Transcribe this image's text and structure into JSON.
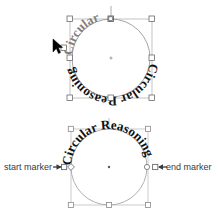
{
  "canvas": {
    "width": 220,
    "height": 221,
    "background": "#ffffff"
  },
  "colors": {
    "path_stroke": "#9a9a9a",
    "bbox_stroke": "#b0b0b0",
    "handle_fill": "#ffffff",
    "handle_stroke": "#555555",
    "text_dark": "#111111",
    "text_gray": "#8a8a8a",
    "label_text": "#3a3a3a",
    "cursor": "#000000"
  },
  "objects": {
    "top": {
      "name": "selected-text-on-circle",
      "text_upper": "Circular",
      "text_lower": "Circular Reasoning",
      "full_text": "Circular Reasoning",
      "selected": true,
      "bbox": {
        "x": 70,
        "y": 19,
        "width": 82,
        "height": 79
      },
      "circle": {
        "cx": 111,
        "cy": 58,
        "r": 39
      },
      "center_marker": "object-center-dot",
      "handles": [
        {
          "name": "handle-top-left",
          "x": 70,
          "y": 19,
          "shape": "square"
        },
        {
          "name": "handle-top-center",
          "x": 111,
          "y": 19,
          "shape": "square"
        },
        {
          "name": "handle-top-right",
          "x": 152,
          "y": 19,
          "shape": "square"
        },
        {
          "name": "handle-middle-left",
          "x": 70,
          "y": 58,
          "shape": "square"
        },
        {
          "name": "handle-middle-right",
          "x": 152,
          "y": 58,
          "shape": "square"
        },
        {
          "name": "handle-bottom-left",
          "x": 70,
          "y": 98,
          "shape": "square"
        },
        {
          "name": "handle-bottom-center",
          "x": 111,
          "y": 98,
          "shape": "square"
        },
        {
          "name": "handle-bottom-right",
          "x": 152,
          "y": 98,
          "shape": "square"
        }
      ],
      "rotation_handle": {
        "name": "rotation-stem",
        "x": 111,
        "y": 6
      },
      "extra_node": {
        "name": "path-node-left",
        "x": 64,
        "y": 48
      }
    },
    "bottom": {
      "name": "text-on-circle-with-markers",
      "text_upper": "Circular Reasoning",
      "selected": false,
      "bbox": {
        "x": 71,
        "y": 129,
        "width": 77,
        "height": 77
      },
      "circle": {
        "cx": 109,
        "cy": 167,
        "r": 38
      },
      "center_marker": "object-center-dot",
      "handles": [
        {
          "name": "handle-top-left",
          "x": 71,
          "y": 129,
          "shape": "square"
        },
        {
          "name": "handle-top-right",
          "x": 148,
          "y": 129,
          "shape": "square"
        },
        {
          "name": "handle-bottom-left",
          "x": 71,
          "y": 205,
          "shape": "square"
        },
        {
          "name": "handle-bottom-center",
          "x": 109,
          "y": 205,
          "shape": "square"
        },
        {
          "name": "handle-bottom-right",
          "x": 148,
          "y": 205,
          "shape": "square"
        }
      ],
      "start_marker": {
        "label": "start marker",
        "arrow": "→",
        "square_x": 62,
        "diamond_x": 71,
        "y": 167
      },
      "end_marker": {
        "label": "end marker",
        "arrow": "←",
        "square_x": 157,
        "diamond_x": 148,
        "y": 167
      },
      "rotation_stem": {
        "name": "rotation-stem",
        "x": 109,
        "y": 118
      }
    }
  },
  "cursor": {
    "name": "mouse-pointer",
    "x": 53,
    "y": 41
  }
}
